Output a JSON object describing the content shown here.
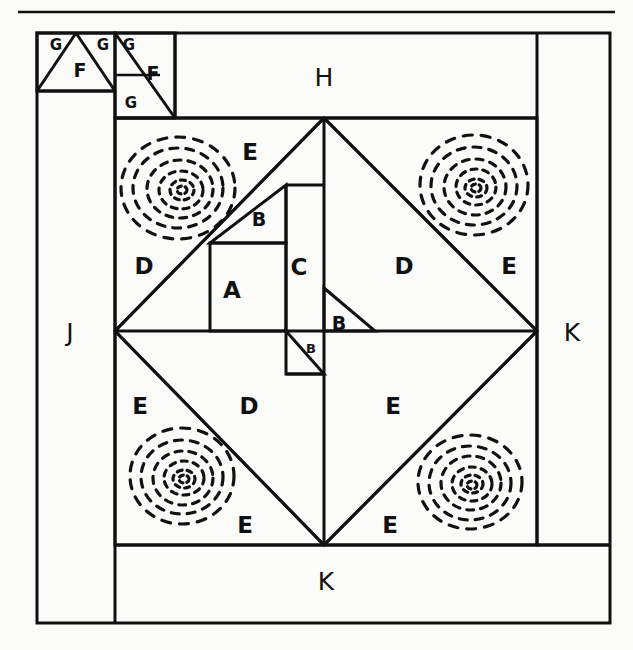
{
  "figure": {
    "kind": "quilt-block-piecing-diagram",
    "background_color": "#fbfbfa",
    "ink_color": "#111111",
    "width": 633,
    "height": 650
  },
  "rules": {
    "top_rule": {
      "x1": 18,
      "y1": 12,
      "x2": 615,
      "y2": 12
    }
  },
  "labels": {
    "g1": "G",
    "g2": "G",
    "g3": "G",
    "g4": "G",
    "f1": "F",
    "f2": "F",
    "h": "H",
    "j": "J",
    "k_right": "K",
    "k_bottom": "K",
    "a": "A",
    "b_upper": "B",
    "b_center_right": "B",
    "b_center_lower": "B",
    "c": "C",
    "d_left": "D",
    "d_upper_right": "D",
    "d_lower_left": "D",
    "e_top": "E",
    "e_right": "E",
    "e_left_lower": "E",
    "e_lower_mid": "E",
    "e_bottom_left": "E",
    "e_bottom_right": "E"
  },
  "label_positions": {
    "g1": {
      "x": 56,
      "y": 44
    },
    "g2": {
      "x": 102,
      "y": 44
    },
    "g3": {
      "x": 130,
      "y": 44
    },
    "g4": {
      "x": 131,
      "y": 102
    },
    "f1": {
      "x": 80,
      "y": 70
    },
    "f2": {
      "x": 152,
      "y": 73
    },
    "h": {
      "x": 324,
      "y": 78
    },
    "j": {
      "x": 70,
      "y": 333
    },
    "k_right": {
      "x": 572,
      "y": 333
    },
    "k_bottom": {
      "x": 326,
      "y": 582
    },
    "a": {
      "x": 232,
      "y": 290
    },
    "b_upper": {
      "x": 259,
      "y": 219
    },
    "b_center_right": {
      "x": 338,
      "y": 323
    },
    "b_center_lower": {
      "x": 311,
      "y": 348
    },
    "c": {
      "x": 298,
      "y": 267
    },
    "d_left": {
      "x": 144,
      "y": 266
    },
    "d_upper_right": {
      "x": 404,
      "y": 266
    },
    "d_lower_left": {
      "x": 249,
      "y": 406
    },
    "e_top": {
      "x": 250,
      "y": 152
    },
    "e_right": {
      "x": 509,
      "y": 266
    },
    "e_left_lower": {
      "x": 140,
      "y": 406
    },
    "e_lower_mid": {
      "x": 393,
      "y": 406
    },
    "e_bottom_left": {
      "x": 245,
      "y": 525
    },
    "e_bottom_right": {
      "x": 390,
      "y": 525
    }
  },
  "geometry": {
    "outer_frame": {
      "x": 37,
      "y": 33,
      "w": 573,
      "h": 590
    },
    "j_strip": {
      "x": 37,
      "y": 91,
      "w": 78,
      "h": 532
    },
    "k_right_strip": {
      "x": 537,
      "y": 33,
      "w": 73,
      "h": 512
    },
    "k_bottom_strip": {
      "x": 115,
      "y": 545,
      "w": 495,
      "h": 78
    },
    "h_strip": {
      "x": 175,
      "y": 33,
      "w": 362,
      "h": 85
    },
    "gf_block_1": {
      "x": 37,
      "y": 33,
      "w": 78,
      "h": 58
    },
    "gf_block_2": {
      "x": 115,
      "y": 33,
      "w": 60,
      "h": 85
    },
    "center_square": {
      "x": 115,
      "y": 118,
      "w": 422,
      "h": 427
    },
    "diamond": {
      "top": {
        "x": 324,
        "y": 118
      },
      "right": {
        "x": 537,
        "y": 331
      },
      "bottom": {
        "x": 324,
        "y": 545
      },
      "left": {
        "x": 115,
        "y": 331
      }
    },
    "a_square": {
      "x": 210,
      "y": 243,
      "w": 76,
      "h": 88
    },
    "c_rect": {
      "x": 286,
      "y": 185,
      "w": 38,
      "h": 146
    },
    "b_upper_triangle": {
      "p1": [
        210,
        243
      ],
      "p2": [
        286,
        243
      ],
      "p3": [
        286,
        185
      ]
    },
    "b_center_right_triangle": {
      "p1": [
        324,
        288
      ],
      "p2": [
        324,
        331
      ],
      "p3": [
        375,
        331
      ]
    },
    "b_center_lower_triangle": {
      "p1": [
        286,
        331
      ],
      "p2": [
        286,
        374
      ],
      "p3": [
        324,
        374
      ]
    },
    "lower_inner_square": {
      "x": 115,
      "y": 331,
      "w": 209,
      "h": 214
    }
  },
  "quilting_motifs": [
    {
      "name": "spiral-top-left",
      "cx": 178,
      "cy": 188,
      "rx": 58,
      "ry": 52
    },
    {
      "name": "spiral-top-right",
      "cx": 474,
      "cy": 185,
      "rx": 54,
      "ry": 50
    },
    {
      "name": "spiral-bottom-left",
      "cx": 182,
      "cy": 476,
      "rx": 52,
      "ry": 48
    },
    {
      "name": "spiral-bottom-right",
      "cx": 470,
      "cy": 482,
      "rx": 52,
      "ry": 47
    }
  ]
}
